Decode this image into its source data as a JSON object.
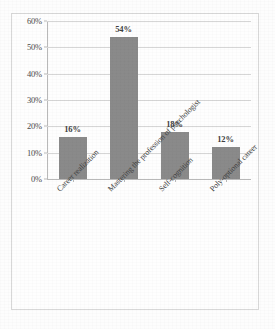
{
  "chart_data": {
    "type": "bar",
    "title": "",
    "subtitle": "",
    "xlabel": "",
    "ylabel": "",
    "categories": [
      "Career realization",
      "Mastering the profession of psychologist",
      "Self-cognition",
      "Poly-optional career"
    ],
    "values": [
      16,
      54,
      18,
      12
    ],
    "data_labels": [
      "16%",
      "54%",
      "18%",
      "12%"
    ],
    "ylim": [
      0,
      60
    ],
    "ytick_values": [
      60,
      50,
      40,
      30,
      20,
      10,
      0
    ],
    "ytick_labels": [
      "60%",
      "50%",
      "40%",
      "30%",
      "20%",
      "10%",
      "0%"
    ],
    "grid": true,
    "grid_axis": "y",
    "legend": false,
    "legend_position": "none",
    "bar_color": "#8a8a8a",
    "gridline_color": "#d6d6d6",
    "axis_color": "#b9b9b9",
    "text_color": "#3f3f3f",
    "background_color": "#fefefe",
    "border_color": "#d8d8d8",
    "xtick_label_rotation": -45
  }
}
